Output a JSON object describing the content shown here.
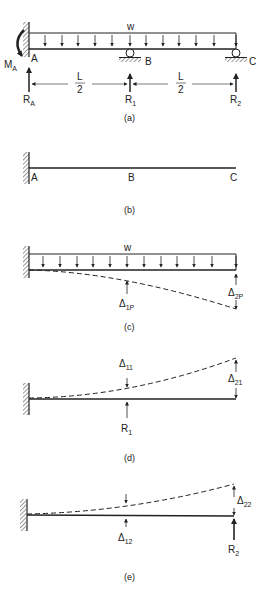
{
  "figure": {
    "panels": [
      {
        "id": "a",
        "caption": "(a)",
        "load_label": "w",
        "points": [
          "A",
          "B",
          "C"
        ],
        "moment_label": "M",
        "moment_sub": "A",
        "reactions": [
          {
            "main": "R",
            "sub": "A"
          },
          {
            "main": "R",
            "sub": "1"
          },
          {
            "main": "R",
            "sub": "2"
          }
        ],
        "spans": [
          {
            "num": "L",
            "den": "2"
          },
          {
            "num": "L",
            "den": "2"
          }
        ]
      },
      {
        "id": "b",
        "caption": "(b)",
        "points": [
          "A",
          "B",
          "C"
        ]
      },
      {
        "id": "c",
        "caption": "(c)",
        "load_label": "w",
        "deflections": [
          {
            "main": "Δ",
            "sub": "1P"
          },
          {
            "main": "Δ",
            "sub": "2P"
          }
        ]
      },
      {
        "id": "d",
        "caption": "(d)",
        "deflections": [
          {
            "main": "Δ",
            "sub": "11"
          },
          {
            "main": "Δ",
            "sub": "21"
          }
        ],
        "reaction": {
          "main": "R",
          "sub": "1"
        }
      },
      {
        "id": "e",
        "caption": "(e)",
        "deflections": [
          {
            "main": "Δ",
            "sub": "12"
          },
          {
            "main": "Δ",
            "sub": "22"
          }
        ],
        "reaction": {
          "main": "R",
          "sub": "2"
        }
      }
    ]
  },
  "colors": {
    "ink": "#222222",
    "background": "#ffffff"
  }
}
